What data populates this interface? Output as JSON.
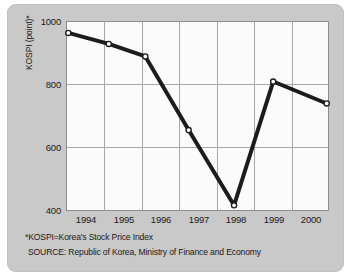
{
  "chart_data": {
    "type": "line",
    "title": "",
    "subtitle": "",
    "xlabel": "",
    "ylabel": "KOSPI (point)*",
    "categories": [
      "1994",
      "1995",
      "1996",
      "1997",
      "1998",
      "1999",
      "2000"
    ],
    "x": [
      1994,
      1995,
      1996,
      1997,
      1998,
      1999,
      2000
    ],
    "values": [
      965,
      930,
      890,
      655,
      415,
      810,
      740
    ],
    "series": [
      {
        "name": "KOSPI",
        "values": [
          965,
          930,
          890,
          655,
          415,
          810,
          740
        ]
      }
    ],
    "ylim": [
      400,
      1000
    ],
    "yticks": [
      400,
      600,
      800,
      1000
    ],
    "ytick_labels": [
      "400",
      "600",
      "800",
      "1000"
    ],
    "xtick_labels": [
      "1994",
      "1995",
      "1996",
      "1997",
      "1998",
      "1999",
      "2000"
    ],
    "grid": true,
    "legend": false,
    "legend_position": "none",
    "marker": "open-circle",
    "line_color": "#1c1c1c",
    "marker_fill": "#ffffff",
    "grid_color": "#a8a8a8",
    "plot_background": "#fbfbfb",
    "panel_background": "#c9c9c9"
  },
  "axes": {
    "y_title": "KOSPI (point)*",
    "y_ticks": [
      "1000",
      "800",
      "600",
      "400"
    ],
    "x_ticks": [
      "1994",
      "1995",
      "1996",
      "1997",
      "1998",
      "1999",
      "2000"
    ]
  },
  "footnotes": {
    "definition": "*KOSPI=Korea's Stock Price Index",
    "source": "SOURCE: Republic of Korea, Ministry of Finance and Economy"
  },
  "colors": {
    "panel": "#c9c9c9",
    "plot_area": "#fbfbfb",
    "frame": "#8e8e8e",
    "grid": "#a8a8a8",
    "line": "#1c1c1c",
    "text": "#1a1a1a"
  }
}
